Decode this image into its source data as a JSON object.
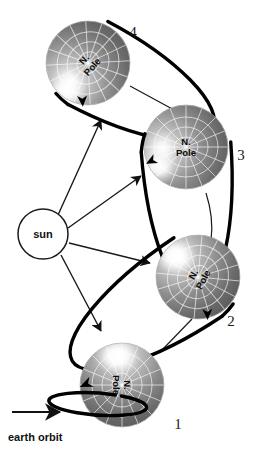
{
  "figure": {
    "background_color": "#ffffff",
    "ink_color": "#1a1a1a"
  },
  "sun": {
    "label": "sun",
    "cx": 43,
    "cy": 234,
    "r": 25,
    "fill": "#ffffff",
    "stroke": "#1a1a1a"
  },
  "orbit_annotation": {
    "label": "earth orbit",
    "x": 8,
    "y": 441,
    "arrow": {
      "x1": 12,
      "y1": 412,
      "x2": 62,
      "y2": 412
    }
  },
  "sun_rays": [
    {
      "name": "ray-to-position-4",
      "x1": 58,
      "y1": 215,
      "x2": 101,
      "y2": 120
    },
    {
      "name": "ray-to-position-3",
      "x1": 68,
      "y1": 228,
      "x2": 141,
      "y2": 176
    },
    {
      "name": "ray-to-position-2",
      "x1": 69,
      "y1": 243,
      "x2": 150,
      "y2": 263
    },
    {
      "name": "ray-to-position-1",
      "x1": 61,
      "y1": 255,
      "x2": 101,
      "y2": 331
    }
  ],
  "connectors": [
    {
      "name": "connector-4-to-3",
      "x1": 130,
      "y1": 86,
      "x2": 176,
      "y2": 111
    },
    {
      "name": "connector-3-to-2",
      "x1": 206,
      "y1": 193,
      "x2": 211,
      "y2": 240
    },
    {
      "name": "connector-2-to-1",
      "x1": 192,
      "y1": 319,
      "x2": 163,
      "y2": 349
    }
  ],
  "globes": [
    {
      "id": "globe-4",
      "number_label": "4",
      "number_x": 133,
      "number_y": 37,
      "pole_label_line1": "N.",
      "pole_label_line2": "Pole",
      "cx": 88,
      "cy": 63,
      "r": 42,
      "pole_text_rotation": -48,
      "highlight_x": 66,
      "highlight_y": 92,
      "axis_tilt_deg": 28,
      "ring_rx": 46,
      "ring_ry": 14,
      "arrow_corner": "lower-right"
    },
    {
      "id": "globe-3",
      "number_label": "3",
      "number_x": 241,
      "number_y": 160,
      "pole_label_line1": "N.",
      "pole_label_line2": "Pole",
      "cx": 186,
      "cy": 147,
      "r": 42,
      "pole_text_rotation": 0,
      "highlight_x": 159,
      "highlight_y": 167,
      "axis_tilt_deg": 86,
      "ring_rx": 44,
      "ring_ry": 13,
      "arrow_corner": "bottom"
    },
    {
      "id": "globe-2",
      "number_label": "2",
      "number_x": 231,
      "number_y": 326,
      "pole_label_line1": "N.",
      "pole_label_line2": "Pole",
      "cx": 198,
      "cy": 277,
      "r": 42,
      "pole_text_rotation": -62,
      "highlight_x": 175,
      "highlight_y": 256,
      "axis_tilt_deg": 34,
      "ring_rx": 46,
      "ring_ry": 14,
      "arrow_corner": "lower-left"
    },
    {
      "id": "globe-1",
      "number_label": "1",
      "number_x": 178,
      "number_y": 429,
      "pole_label_line1": "N.",
      "pole_label_line2": "Pole",
      "cx": 122,
      "cy": 385,
      "r": 42,
      "pole_text_rotation": 90,
      "highlight_x": 116,
      "highlight_y": 356,
      "axis_tilt_deg": 4,
      "ring_rx": 49,
      "ring_ry": 11,
      "arrow_corner": "left"
    }
  ]
}
